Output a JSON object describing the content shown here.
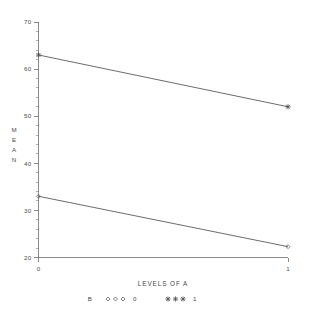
{
  "chart_data": {
    "type": "line",
    "title": "",
    "subtitle": "",
    "xlabel": "LEVELS OF A",
    "ylabel": "MEAN",
    "ylabel_chars": [
      "M",
      "E",
      "A",
      "N"
    ],
    "x": [
      0,
      1
    ],
    "categories": [
      "0",
      "1"
    ],
    "xlim": [
      0,
      1
    ],
    "ylim": [
      20,
      70
    ],
    "ytick_labels": [
      "70",
      "60",
      "50",
      "40",
      "30",
      "20"
    ],
    "ytick_values": [
      70,
      60,
      50,
      40,
      30,
      20
    ],
    "ytick_minor_step": 2,
    "xtick_labels": [
      "0",
      "1"
    ],
    "grid": false,
    "legend_position": "bottom",
    "legend_title": "B",
    "series": [
      {
        "name": "1",
        "label": "1",
        "marker": "filled-star",
        "values": [
          63.0,
          52.0
        ]
      },
      {
        "name": "0",
        "label": "0",
        "marker": "open-diamond",
        "values": [
          33.0,
          22.3
        ]
      }
    ],
    "colors": {
      "axis": "#6e6e6e",
      "line": "#5a5a5a",
      "text": "#4a4a4a",
      "background": "#ffffff"
    }
  },
  "legend": {
    "title": "B",
    "entries": [
      {
        "marker_glyph": "◇◇◇",
        "label": "0"
      },
      {
        "marker_glyph": "✦✦✦",
        "label": "1"
      }
    ]
  },
  "axes": {
    "x_title": "LEVELS OF A",
    "y_title": "MEAN"
  }
}
